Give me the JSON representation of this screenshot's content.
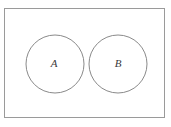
{
  "diagram": {
    "type": "venn-disjoint-sets",
    "sets": [
      {
        "label": "A"
      },
      {
        "label": "B"
      }
    ],
    "colors": {
      "background": "#ffffff",
      "rect_stroke": "#9a9a9a",
      "circle_stroke": "#8a8a8a",
      "label": "#3a3a3a"
    }
  }
}
